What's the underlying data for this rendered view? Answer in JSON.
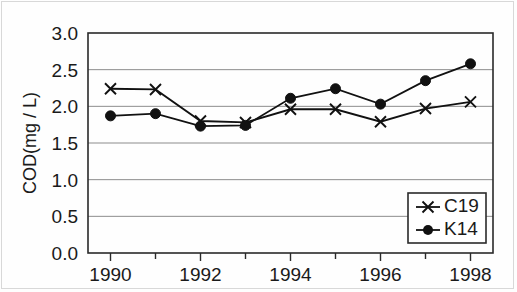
{
  "chart_data": {
    "type": "line",
    "title": "",
    "subtitle": "",
    "xlabel": "",
    "ylabel": "COD(mg / L)",
    "x": [
      1990,
      1991,
      1992,
      1993,
      1994,
      1995,
      1996,
      1997,
      1998
    ],
    "xlim": [
      1989.5,
      1998.5
    ],
    "ylim": [
      0.0,
      3.0
    ],
    "grid": "horizontal",
    "legend_position": "lower-right",
    "x_major_ticks": [
      1990,
      1992,
      1994,
      1996,
      1998
    ],
    "x_tick_labels": [
      "1990",
      "1992",
      "1994",
      "1996",
      "1998"
    ],
    "x_minor_ticks": [
      1991,
      1993,
      1995,
      1997
    ],
    "y_ticks": [
      0.0,
      0.5,
      1.0,
      1.5,
      2.0,
      2.5,
      3.0
    ],
    "y_tick_labels": [
      "0.0",
      "0.5",
      "1.0",
      "1.5",
      "2.0",
      "2.5",
      "3.0"
    ],
    "series": [
      {
        "name": "C19",
        "marker": "x",
        "color": "#111111",
        "values": [
          2.24,
          2.23,
          1.8,
          1.78,
          1.96,
          1.96,
          1.79,
          1.97,
          2.06
        ]
      },
      {
        "name": "K14",
        "marker": "circle",
        "color": "#111111",
        "values": [
          1.87,
          1.9,
          1.73,
          1.74,
          2.11,
          2.24,
          2.03,
          2.35,
          2.58
        ]
      }
    ]
  },
  "legend": {
    "entries": [
      {
        "label": "C19",
        "marker": "x-marker-icon"
      },
      {
        "label": "K14",
        "marker": "dot-marker-icon"
      }
    ]
  },
  "colors": {
    "ink": "#111111",
    "grid": "#8c8c8c",
    "frame": "#2a2a2a",
    "background": "#fefefe"
  }
}
